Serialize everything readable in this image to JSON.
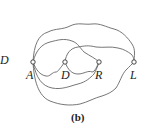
{
  "figure": {
    "caption": "(b)",
    "side_label": "D",
    "nodes": [
      {
        "id": "A",
        "label": "A"
      },
      {
        "id": "D",
        "label": "D"
      },
      {
        "id": "R",
        "label": "R"
      },
      {
        "id": "L",
        "label": "L"
      }
    ]
  }
}
